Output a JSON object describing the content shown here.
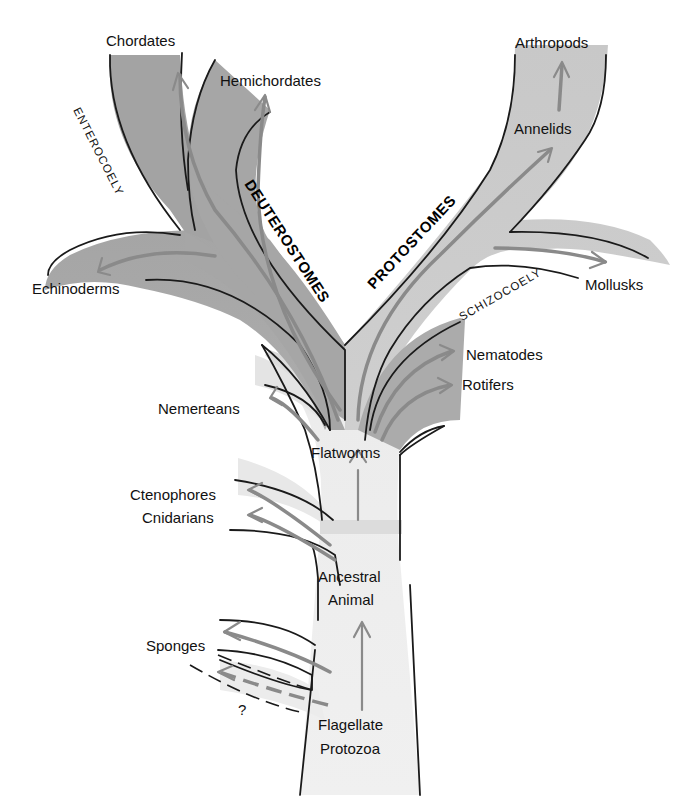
{
  "diagram": {
    "type": "phylogenetic-tree",
    "colors": {
      "dark_branch": "#a7a7a7",
      "light_branch": "#e6e6e6",
      "mid_branch": "#c9c9c9",
      "arrow": "#8a8a8a",
      "outline": "#1a1a1a",
      "background": "#ffffff"
    },
    "group_labels": {
      "deuterostomes": "DEUTEROSTOMES",
      "protostomes": "PROTOSTOMES",
      "enterocoely": "ENTEROCOELY",
      "schizocoely": "SCHIZOCOELY"
    },
    "taxa": {
      "chordates": "Chordates",
      "hemichordates": "Hemichordates",
      "echinoderms": "Echinoderms",
      "arthropods": "Arthropods",
      "annelids": "Annelids",
      "mollusks": "Mollusks",
      "nematodes": "Nematodes",
      "rotifers": "Rotifers",
      "nemerteans": "Nemerteans",
      "flatworms": "Flatworms",
      "ctenophores": "Ctenophores",
      "cnidarians": "Cnidarians",
      "ancestral_animal_line1": "Ancestral",
      "ancestral_animal_line2": "Animal",
      "sponges": "Sponges",
      "unknown": "?",
      "flagellate_protozoa_line1": "Flagellate",
      "flagellate_protozoa_line2": "Protozoa"
    }
  }
}
